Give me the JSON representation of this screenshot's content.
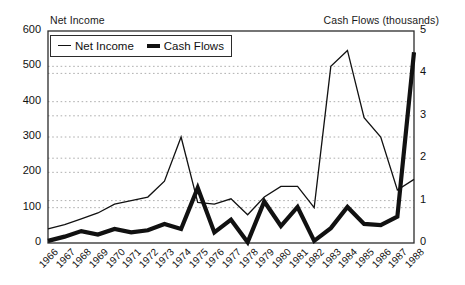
{
  "chart_data": {
    "type": "line",
    "title": "",
    "x": [
      1966,
      1967,
      1968,
      1969,
      1970,
      1971,
      1972,
      1973,
      1974,
      1975,
      1976,
      1977,
      1978,
      1979,
      1980,
      1981,
      1982,
      1983,
      1984,
      1985,
      1986,
      1987,
      1988
    ],
    "xlabel": "",
    "categories": [
      "1966",
      "1967",
      "1968",
      "1969",
      "1970",
      "1971",
      "1972",
      "1973",
      "1974",
      "1975",
      "1976",
      "1977",
      "1978",
      "1979",
      "1980",
      "1981",
      "1982",
      "1983",
      "1984",
      "1985",
      "1986",
      "1987",
      "1988"
    ],
    "grid": true,
    "legend_position": "top-left inside plot",
    "series": [
      {
        "name": "Net Income",
        "axis": "left",
        "ylabel": "Net Income",
        "ylim": [
          0,
          600
        ],
        "ytick_values": [
          "0",
          "100",
          "200",
          "300",
          "400",
          "500",
          "600"
        ],
        "style": "thin-line",
        "values": [
          40,
          52,
          68,
          85,
          110,
          120,
          130,
          175,
          300,
          115,
          110,
          125,
          80,
          130,
          160,
          160,
          100,
          500,
          545,
          355,
          300,
          150,
          180
        ]
      },
      {
        "name": "Cash Flows",
        "axis": "right",
        "ylabel": "Cash Flows (thousands)",
        "ylim": [
          0,
          5
        ],
        "ytick_values": [
          "0",
          "1",
          "2",
          "3",
          "4",
          "5"
        ],
        "style": "thick-line",
        "values": [
          0.05,
          0.15,
          0.28,
          0.2,
          0.33,
          0.25,
          0.3,
          0.45,
          0.33,
          1.3,
          0.25,
          0.55,
          0.02,
          0.98,
          0.4,
          0.85,
          0.05,
          0.35,
          0.85,
          0.45,
          0.42,
          0.62,
          4.5
        ]
      }
    ]
  },
  "axes": {
    "left_title": "Net Income",
    "right_title": "Cash Flows (thousands)",
    "left_ticks": [
      "600",
      "500",
      "400",
      "300",
      "200",
      "100",
      "0"
    ],
    "right_ticks": [
      "5",
      "4",
      "3",
      "2",
      "1",
      "0"
    ],
    "x_ticks": [
      "1966",
      "1967",
      "1968",
      "1969",
      "1970",
      "1971",
      "1972",
      "1973",
      "1974",
      "1975",
      "1976",
      "1977",
      "1978",
      "1979",
      "1980",
      "1981",
      "1982",
      "1983",
      "1984",
      "1985",
      "1986",
      "1987",
      "1988"
    ]
  },
  "legend": {
    "items": [
      {
        "label": "Net Income",
        "marker": "thin-line-swatch"
      },
      {
        "label": "Cash Flows",
        "marker": "thick-line-swatch"
      }
    ]
  },
  "colors": {
    "line": "#111111",
    "grid": "#9a9a9a",
    "frame": "#2b2b2b",
    "background": "#ffffff"
  }
}
